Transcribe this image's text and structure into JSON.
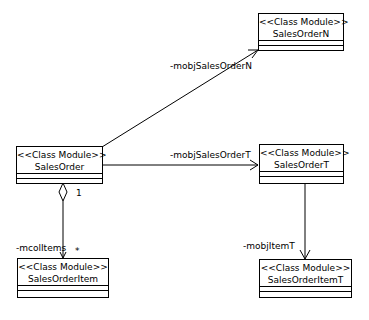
{
  "diagram": {
    "type": "UML class diagram",
    "classes": [
      {
        "id": "SalesOrderN",
        "stereotype": "<<Class Module>>",
        "name": "SalesOrderN"
      },
      {
        "id": "SalesOrder",
        "stereotype": "<<Class Module>>",
        "name": "SalesOrder"
      },
      {
        "id": "SalesOrderT",
        "stereotype": "<<Class Module>>",
        "name": "SalesOrderT"
      },
      {
        "id": "SalesOrderItem",
        "stereotype": "<<Class Module>>",
        "name": "SalesOrderItem"
      },
      {
        "id": "SalesOrderItemT",
        "stereotype": "<<Class Module>>",
        "name": "SalesOrderItemT"
      }
    ],
    "associations": [
      {
        "from": "SalesOrder",
        "to": "SalesOrderN",
        "role": "-mobjSalesOrderN",
        "kind": "directed"
      },
      {
        "from": "SalesOrder",
        "to": "SalesOrderT",
        "role": "-mobjSalesOrderT",
        "kind": "directed"
      },
      {
        "from": "SalesOrder",
        "to": "SalesOrderItem",
        "role": "-mcolItems",
        "kind": "aggregation",
        "source_multiplicity": "1",
        "target_multiplicity": "*"
      },
      {
        "from": "SalesOrderT",
        "to": "SalesOrderItemT",
        "role": "-mobjItemT",
        "kind": "directed"
      }
    ]
  }
}
